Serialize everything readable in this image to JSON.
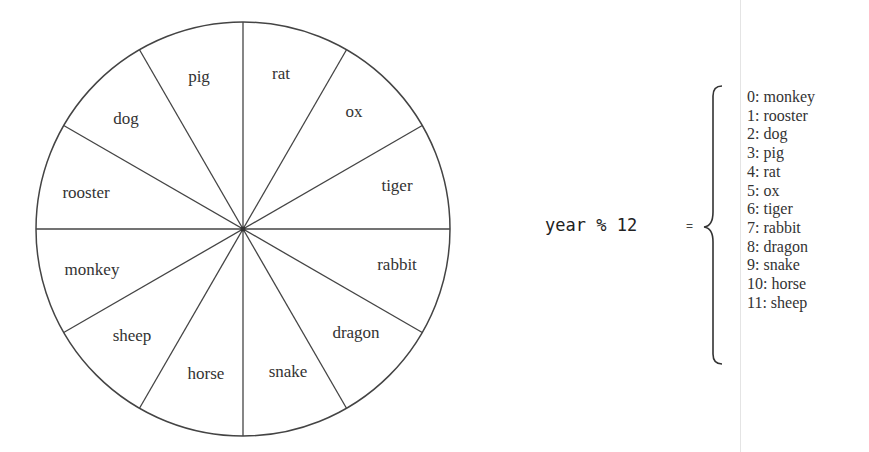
{
  "wheel": {
    "center": [
      243,
      229
    ],
    "radius": 207,
    "stroke_color": "#444444",
    "segments": [
      {
        "name": "rat",
        "label_pos": [
          281,
          79
        ]
      },
      {
        "name": "ox",
        "label_pos": [
          354,
          117
        ]
      },
      {
        "name": "tiger",
        "label_pos": [
          397,
          191
        ]
      },
      {
        "name": "rabbit",
        "label_pos": [
          397,
          270
        ]
      },
      {
        "name": "dragon",
        "label_pos": [
          356,
          338
        ]
      },
      {
        "name": "snake",
        "label_pos": [
          288,
          377
        ]
      },
      {
        "name": "horse",
        "label_pos": [
          206,
          379
        ]
      },
      {
        "name": "sheep",
        "label_pos": [
          132,
          341
        ]
      },
      {
        "name": "monkey",
        "label_pos": [
          92,
          275
        ]
      },
      {
        "name": "rooster",
        "label_pos": [
          86,
          198
        ]
      },
      {
        "name": "dog",
        "label_pos": [
          126,
          124
        ]
      },
      {
        "name": "pig",
        "label_pos": [
          199,
          82
        ]
      }
    ]
  },
  "formula": {
    "expression": "year % 12",
    "equals": "="
  },
  "mapping": [
    "0: monkey",
    "1: rooster",
    "2: dog",
    "3: pig",
    "4: rat",
    "5: ox",
    "6: tiger",
    "7: rabbit",
    "8: dragon",
    "9: snake",
    "10: horse",
    "11: sheep"
  ]
}
